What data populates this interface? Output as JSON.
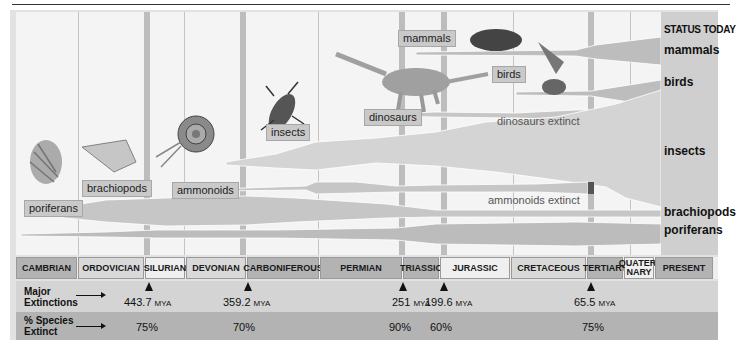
{
  "status_column": {
    "heading": "STATUS TODAY",
    "items": [
      "mammals",
      "birds",
      "insects",
      "brachiopods",
      "poriferans"
    ]
  },
  "organism_tags": {
    "poriferans": "poriferans",
    "brachiopods": "brachiopods",
    "ammonoids": "ammonoids",
    "insects": "insects",
    "dinosaurs": "dinosaurs",
    "mammals": "mammals",
    "birds": "birds"
  },
  "extinction_labels": {
    "dinosaurs": "dinosaurs extinct",
    "ammonoids": "ammonoids extinct"
  },
  "periods": [
    {
      "name": "CAMBRIAN",
      "shade": "dark"
    },
    {
      "name": "ORDOVICIAN",
      "shade": "light"
    },
    {
      "name": "SILURIAN",
      "shade": "white"
    },
    {
      "name": "DEVONIAN",
      "shade": "light"
    },
    {
      "name": "CARBONIFEROUS",
      "shade": "dark"
    },
    {
      "name": "PERMIAN",
      "shade": "dark"
    },
    {
      "name": "TRIASSIC",
      "shade": "dark"
    },
    {
      "name": "JURASSIC",
      "shade": "white"
    },
    {
      "name": "CRETACEOUS",
      "shade": "light"
    },
    {
      "name": "TERTIARY",
      "shade": "dark"
    },
    {
      "name": "QUATER-NARY",
      "shade": "white"
    },
    {
      "name": "PRESENT",
      "shade": "dark"
    }
  ],
  "rows": {
    "major_extinctions_label": "Major Extinctions",
    "species_extinct_label": "% Species Extinct"
  },
  "extinctions": [
    {
      "value": "443.7",
      "unit": "MYA",
      "percent": "75%"
    },
    {
      "value": "359.2",
      "unit": "MYA",
      "percent": "70%"
    },
    {
      "value": "251",
      "unit": "MYA",
      "percent": "90%"
    },
    {
      "value": "199.6",
      "unit": "MYA",
      "percent": "60%"
    },
    {
      "value": "65.5",
      "unit": "MYA",
      "percent": "75%"
    }
  ],
  "colors": {
    "plot_bg": "#f4f4f4",
    "lane_fill": "#c6c6c6",
    "period_dark": "#b3b3b3",
    "period_light": "#d9d9d9",
    "row_extinctions": "#d4d4d4",
    "row_percent": "#b3b3b3"
  }
}
